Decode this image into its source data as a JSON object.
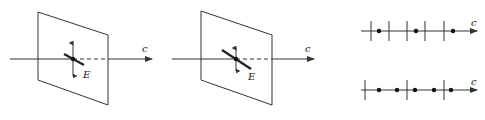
{
  "figure": {
    "panels": [
      {
        "id": "transverse-wave-plane-1",
        "plane": [
          [
            38,
            12
          ],
          [
            108,
            35
          ],
          [
            108,
            105
          ],
          [
            38,
            80
          ]
        ],
        "axis": {
          "y": 59,
          "x_start": 10,
          "x_end": 152,
          "hidden_from": 73,
          "hidden_to": 108
        },
        "center": [
          73,
          59
        ],
        "vertical_arrow": {
          "y_top": 43,
          "y_bottom": 76
        },
        "oblique_bar": {
          "from": [
            64,
            54
          ],
          "to": [
            84,
            65
          ]
        },
        "labels": {
          "propagation": "c",
          "field": "E"
        },
        "label_pos": {
          "c": [
            142,
            52
          ],
          "E": [
            83,
            78
          ]
        }
      },
      {
        "id": "transverse-wave-plane-2",
        "plane": [
          [
            201,
            11
          ],
          [
            272,
            35
          ],
          [
            272,
            105
          ],
          [
            201,
            80
          ]
        ],
        "axis": {
          "y": 59,
          "x_start": 172,
          "x_end": 314,
          "hidden_from": 236,
          "hidden_to": 272
        },
        "center": [
          236,
          59
        ],
        "vertical_arrow": {
          "y_top": 48,
          "y_bottom": 71
        },
        "oblique_bar": {
          "from": [
            222,
            50
          ],
          "to": [
            251,
            69
          ]
        },
        "labels": {
          "propagation": "c",
          "field": "E"
        },
        "label_pos": {
          "c": [
            305,
            52
          ],
          "E": [
            248,
            80
          ]
        }
      }
    ],
    "wave_lines": [
      {
        "id": "wave-line-top",
        "axis": {
          "y": 31,
          "x_start": 361,
          "x_end": 477
        },
        "ticks_x": [
          371,
          389,
          407,
          425,
          444
        ],
        "tick_half_height": 10,
        "dots_x": [
          379,
          416,
          453
        ],
        "label": "c",
        "label_pos": [
          471,
          26
        ]
      },
      {
        "id": "wave-line-bottom",
        "axis": {
          "y": 90,
          "x_start": 361,
          "x_end": 477
        },
        "ticks_x": [
          365,
          407,
          444
        ],
        "tick_half_height": 10,
        "dots_x": [
          379,
          397,
          415,
          434,
          451
        ],
        "label": "c",
        "label_pos": [
          471,
          85
        ]
      }
    ],
    "colors": {
      "stroke": "#333333",
      "background": "#ffffff"
    }
  }
}
